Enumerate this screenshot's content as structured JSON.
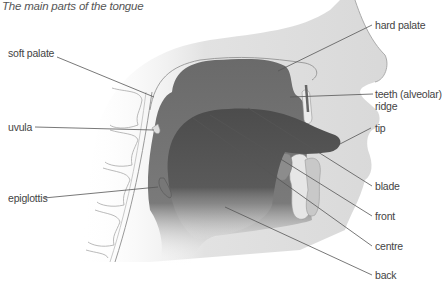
{
  "title": "The main parts of the tongue",
  "labels": {
    "soft_palate": "soft palate",
    "uvula": "uvula",
    "epiglottis": "epiglottis",
    "hard_palate": "hard palate",
    "teeth_line1": "teeth (alveolar)",
    "teeth_line2": "ridge",
    "tip": "tip",
    "blade": "blade",
    "front": "front",
    "centre": "centre",
    "back": "back"
  },
  "colors": {
    "tongue": "#505050",
    "mouth_cavity": "#6e6e6e",
    "tissue": "#d4d4d4",
    "leader_line": "#555555",
    "text": "#444444"
  }
}
